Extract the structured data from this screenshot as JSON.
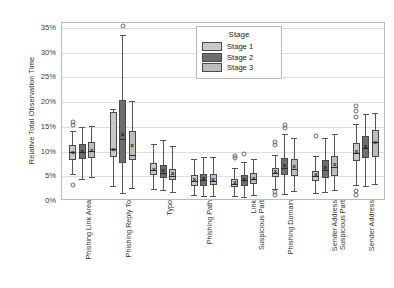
{
  "chart_data": {
    "type": "box",
    "title": "",
    "xlabel": "",
    "ylabel": "Relative Total Observation Time",
    "ylim": [
      0,
      36
    ],
    "ytick_values": [
      0,
      5,
      10,
      15,
      20,
      25,
      30,
      35
    ],
    "ytick_labels": [
      "0%",
      "5%",
      "10%",
      "15%",
      "20%",
      "25%",
      "30%",
      "35%"
    ],
    "grid": true,
    "legend": {
      "title": "Stage",
      "position": "top-right",
      "entries": [
        {
          "label": "Stage 1",
          "color": "#c9c9c9"
        },
        {
          "label": "Stage 2",
          "color": "#6e6e6e"
        },
        {
          "label": "Stage 3",
          "color": "#bdbdbd"
        }
      ]
    },
    "categories": [
      "Phishing Link Area",
      "Phishing Reply To",
      "Typo",
      "Phishing Path",
      "Link\nSuspicious Part",
      "Phishing Domain",
      "Sender Address\nSuspicious Part",
      "Sender Address"
    ],
    "category_lines": [
      [
        "Phishing Link Area"
      ],
      [
        "Phishing Reply To"
      ],
      [
        "Typo"
      ],
      [
        "Phishing Path"
      ],
      [
        "Link",
        "Suspicious Part"
      ],
      [
        "Phishing Domain"
      ],
      [
        "Sender Address",
        "Suspicious Part"
      ],
      [
        "Sender Address"
      ]
    ],
    "series": [
      {
        "name": "Stage 1",
        "color": "#c9c9c9",
        "boxes": [
          {
            "category": "Phishing Link Area",
            "whisker_low": 5.4,
            "q1": 8.3,
            "median": 9.9,
            "q3": 11.4,
            "whisker_high": 14.2,
            "mean": 9.8,
            "outliers": [
              15.3,
              15.9,
              3.3
            ]
          },
          {
            "category": "Phishing Reply To",
            "whisker_low": 3.0,
            "q1": 9.0,
            "median": 10.6,
            "q3": 18.0,
            "whisker_high": 18.6,
            "mean": 10.3,
            "outliers": []
          },
          {
            "category": "Typo",
            "whisker_low": 2.4,
            "q1": 5.2,
            "median": 6.2,
            "q3": 7.7,
            "whisker_high": 11.6,
            "mean": 6.3,
            "outliers": []
          },
          {
            "category": "Phishing Path",
            "whisker_low": 1.2,
            "q1": 3.0,
            "median": 4.0,
            "q3": 5.2,
            "whisker_high": 8.5,
            "mean": 4.2,
            "outliers": []
          },
          {
            "category": "Link Suspicious Part",
            "whisker_low": 1.0,
            "q1": 2.8,
            "median": 3.5,
            "q3": 4.4,
            "whisker_high": 6.6,
            "mean": 3.7,
            "outliers": [
              8.6,
              9.2
            ]
          },
          {
            "category": "Phishing Domain",
            "whisker_low": 2.5,
            "q1": 4.8,
            "median": 5.6,
            "q3": 6.6,
            "whisker_high": 9.3,
            "mean": 5.8,
            "outliers": [
              1.3,
              1.8,
              11.3,
              12.0
            ]
          },
          {
            "category": "Sender Address Suspicious Part",
            "whisker_low": 1.6,
            "q1": 4.0,
            "median": 5.0,
            "q3": 6.1,
            "whisker_high": 9.2,
            "mean": 5.3,
            "outliers": [
              13.2
            ]
          },
          {
            "category": "Sender Address",
            "whisker_low": 3.2,
            "q1": 8.1,
            "median": 9.8,
            "q3": 11.7,
            "whisker_high": 15.6,
            "mean": 10.0,
            "outliers": [
              17.0,
              18.3,
              19.3,
              1.2,
              2.1
            ]
          }
        ]
      },
      {
        "name": "Stage 2",
        "color": "#6e6e6e",
        "boxes": [
          {
            "category": "Phishing Link Area",
            "whisker_low": 4.4,
            "q1": 8.4,
            "median": 10.0,
            "q3": 11.5,
            "whisker_high": 14.9,
            "mean": 10.0,
            "outliers": []
          },
          {
            "category": "Phishing Reply To",
            "whisker_low": 1.6,
            "q1": 7.6,
            "median": 12.6,
            "q3": 20.4,
            "whisker_high": 33.6,
            "mean": 13.4,
            "outliers": [
              35.4
            ]
          },
          {
            "category": "Typo",
            "whisker_low": 2.2,
            "q1": 4.6,
            "median": 5.6,
            "q3": 7.3,
            "whisker_high": 12.3,
            "mean": 6.0,
            "outliers": []
          },
          {
            "category": "Phishing Path",
            "whisker_low": 1.0,
            "q1": 3.1,
            "median": 4.2,
            "q3": 5.5,
            "whisker_high": 9.0,
            "mean": 4.4,
            "outliers": []
          },
          {
            "category": "Link Suspicious Part",
            "whisker_low": 0.9,
            "q1": 3.1,
            "median": 4.2,
            "q3": 5.2,
            "whisker_high": 7.8,
            "mean": 4.3,
            "outliers": [
              9.6
            ]
          },
          {
            "category": "Phishing Domain",
            "whisker_low": 1.4,
            "q1": 5.2,
            "median": 6.6,
            "q3": 8.7,
            "whisker_high": 13.6,
            "mean": 7.0,
            "outliers": [
              14.8,
              15.4
            ]
          },
          {
            "category": "Sender Address Suspicious Part",
            "whisker_low": 1.8,
            "q1": 4.6,
            "median": 6.3,
            "q3": 8.2,
            "whisker_high": 12.8,
            "mean": 6.7,
            "outliers": []
          },
          {
            "category": "Sender Address",
            "whisker_low": 3.0,
            "q1": 8.6,
            "median": 10.8,
            "q3": 13.1,
            "whisker_high": 17.6,
            "mean": 11.0,
            "outliers": []
          }
        ]
      },
      {
        "name": "Stage 3",
        "color": "#bdbdbd",
        "boxes": [
          {
            "category": "Phishing Link Area",
            "whisker_low": 4.8,
            "q1": 8.7,
            "median": 10.2,
            "q3": 12.0,
            "whisker_high": 15.2,
            "mean": 10.1,
            "outliers": []
          },
          {
            "category": "Phishing Reply To",
            "whisker_low": 2.6,
            "q1": 8.2,
            "median": 9.4,
            "q3": 14.2,
            "whisker_high": 20.3,
            "mean": 11.2,
            "outliers": []
          },
          {
            "category": "Typo",
            "whisker_low": 1.9,
            "q1": 4.2,
            "median": 5.1,
            "q3": 6.4,
            "whisker_high": 11.2,
            "mean": 5.4,
            "outliers": []
          },
          {
            "category": "Phishing Path",
            "whisker_low": 1.1,
            "q1": 3.2,
            "median": 4.1,
            "q3": 5.4,
            "whisker_high": 8.8,
            "mean": 4.3,
            "outliers": []
          },
          {
            "category": "Link Suspicious Part",
            "whisker_low": 1.2,
            "q1": 3.4,
            "median": 4.4,
            "q3": 5.6,
            "whisker_high": 8.4,
            "mean": 4.5,
            "outliers": []
          },
          {
            "category": "Phishing Domain",
            "whisker_low": 2.0,
            "q1": 5.0,
            "median": 6.4,
            "q3": 8.4,
            "whisker_high": 12.8,
            "mean": 6.8,
            "outliers": []
          },
          {
            "category": "Sender Address Suspicious Part",
            "whisker_low": 2.2,
            "q1": 5.0,
            "median": 6.8,
            "q3": 9.1,
            "whisker_high": 13.6,
            "mean": 7.2,
            "outliers": []
          },
          {
            "category": "Sender Address",
            "whisker_low": 3.4,
            "q1": 8.8,
            "median": 12.0,
            "q3": 14.4,
            "whisker_high": 17.8,
            "mean": 11.8,
            "outliers": []
          }
        ]
      }
    ]
  }
}
